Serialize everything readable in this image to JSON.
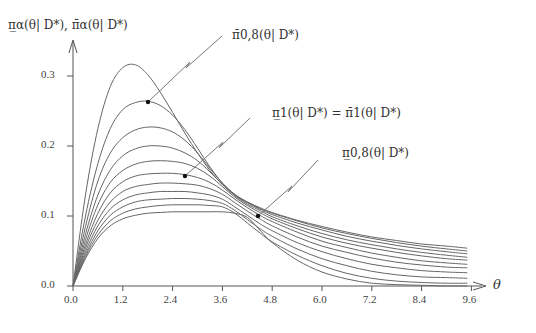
{
  "chart_data": {
    "type": "line",
    "title": "",
    "ylabel": "π̲_α(θ| D*), π̄_α(θ| D*)",
    "xlabel": "θ",
    "xlim": [
      0,
      9.6
    ],
    "ylim": [
      0,
      0.3
    ],
    "xticks": [
      "0.0",
      "1.2",
      "2.4",
      "3.6",
      "4.8",
      "6.0",
      "7.2",
      "8.4",
      "9.6"
    ],
    "yticks": [
      "0.0",
      "0.1",
      "0.2",
      "0.3"
    ],
    "grid": false,
    "x": [
      0,
      0.3,
      0.6,
      0.9,
      1.2,
      1.5,
      1.8,
      2.1,
      2.4,
      2.7,
      3.0,
      3.3,
      3.6,
      3.9,
      4.2,
      4.5,
      4.8,
      5.4,
      6.0,
      6.6,
      7.2,
      7.8,
      8.4,
      9.0,
      9.5
    ],
    "series": [
      {
        "name": "curve-1",
        "values": [
          0,
          0.13,
          0.225,
          0.285,
          0.312,
          0.316,
          0.302,
          0.277,
          0.248,
          0.218,
          0.19,
          0.165,
          0.145,
          0.13,
          0.12,
          0.112,
          0.105,
          0.094,
          0.085,
          0.077,
          0.07,
          0.065,
          0.06,
          0.057,
          0.054
        ]
      },
      {
        "name": "curve-2",
        "values": [
          0,
          0.1,
          0.175,
          0.225,
          0.252,
          0.262,
          0.264,
          0.258,
          0.244,
          0.223,
          0.197,
          0.17,
          0.147,
          0.131,
          0.12,
          0.111,
          0.104,
          0.093,
          0.083,
          0.075,
          0.068,
          0.062,
          0.057,
          0.053,
          0.05
        ]
      },
      {
        "name": "curve-3",
        "values": [
          0,
          0.085,
          0.15,
          0.19,
          0.212,
          0.223,
          0.227,
          0.226,
          0.22,
          0.208,
          0.19,
          0.168,
          0.147,
          0.13,
          0.119,
          0.11,
          0.102,
          0.09,
          0.08,
          0.071,
          0.064,
          0.058,
          0.053,
          0.049,
          0.046
        ]
      },
      {
        "name": "curve-4",
        "values": [
          0,
          0.074,
          0.13,
          0.166,
          0.186,
          0.196,
          0.2,
          0.2,
          0.197,
          0.19,
          0.179,
          0.163,
          0.145,
          0.129,
          0.117,
          0.108,
          0.099,
          0.086,
          0.075,
          0.066,
          0.059,
          0.053,
          0.048,
          0.044,
          0.041
        ]
      },
      {
        "name": "curve-5",
        "values": [
          0,
          0.066,
          0.116,
          0.148,
          0.165,
          0.174,
          0.178,
          0.179,
          0.178,
          0.175,
          0.168,
          0.157,
          0.142,
          0.127,
          0.115,
          0.105,
          0.096,
          0.082,
          0.07,
          0.061,
          0.054,
          0.048,
          0.043,
          0.039,
          0.037
        ]
      },
      {
        "name": "curve-6",
        "values": [
          0,
          0.059,
          0.104,
          0.133,
          0.149,
          0.157,
          0.16,
          0.161,
          0.161,
          0.159,
          0.155,
          0.148,
          0.137,
          0.124,
          0.112,
          0.101,
          0.092,
          0.077,
          0.064,
          0.055,
          0.047,
          0.041,
          0.036,
          0.033,
          0.031
        ]
      },
      {
        "name": "curve-7",
        "values": [
          0,
          0.054,
          0.094,
          0.12,
          0.135,
          0.142,
          0.145,
          0.147,
          0.147,
          0.146,
          0.144,
          0.139,
          0.131,
          0.119,
          0.107,
          0.096,
          0.086,
          0.07,
          0.057,
          0.048,
          0.04,
          0.034,
          0.03,
          0.027,
          0.026
        ]
      },
      {
        "name": "curve-8",
        "values": [
          0,
          0.049,
          0.086,
          0.11,
          0.123,
          0.13,
          0.133,
          0.135,
          0.135,
          0.135,
          0.133,
          0.13,
          0.124,
          0.113,
          0.101,
          0.089,
          0.079,
          0.062,
          0.049,
          0.039,
          0.031,
          0.026,
          0.022,
          0.02,
          0.019
        ]
      },
      {
        "name": "curve-9",
        "values": [
          0,
          0.045,
          0.079,
          0.101,
          0.113,
          0.12,
          0.123,
          0.124,
          0.125,
          0.125,
          0.124,
          0.122,
          0.118,
          0.108,
          0.095,
          0.082,
          0.071,
          0.053,
          0.039,
          0.029,
          0.021,
          0.016,
          0.013,
          0.012,
          0.011
        ]
      },
      {
        "name": "curve-10",
        "values": [
          0,
          0.042,
          0.073,
          0.093,
          0.104,
          0.11,
          0.113,
          0.115,
          0.116,
          0.116,
          0.116,
          0.115,
          0.113,
          0.104,
          0.09,
          0.076,
          0.063,
          0.044,
          0.029,
          0.018,
          0.011,
          0.007,
          0.005,
          0.004,
          0.004
        ]
      },
      {
        "name": "curve-11",
        "values": [
          0,
          0.039,
          0.068,
          0.086,
          0.096,
          0.101,
          0.104,
          0.105,
          0.106,
          0.106,
          0.106,
          0.106,
          0.106,
          0.104,
          0.098,
          0.08,
          0.062,
          0.037,
          0.02,
          0.01,
          0.004,
          0.002,
          0.001,
          0.0,
          0.0
        ]
      }
    ],
    "annotations": [
      {
        "label": "π̄_{0,8}(θ| D*)",
        "point": [
          1.8,
          0.264
        ]
      },
      {
        "label": "π̲_1(θ| D*) = π̄_1(θ| D*)",
        "point": [
          2.7,
          0.157
        ]
      },
      {
        "label": "π̲_{0,8}(θ| D*)",
        "point": [
          4.46,
          0.1
        ]
      }
    ]
  },
  "labels": {
    "ylabel": "π̲α(θ| D*), π̄α(θ| D*)",
    "xlabel": "θ",
    "ann1": "π̄0,8(θ| D*)",
    "ann2": "π̲1(θ| D*) = π̄1(θ| D*)",
    "ann3": "π̲0,8(θ| D*)"
  }
}
